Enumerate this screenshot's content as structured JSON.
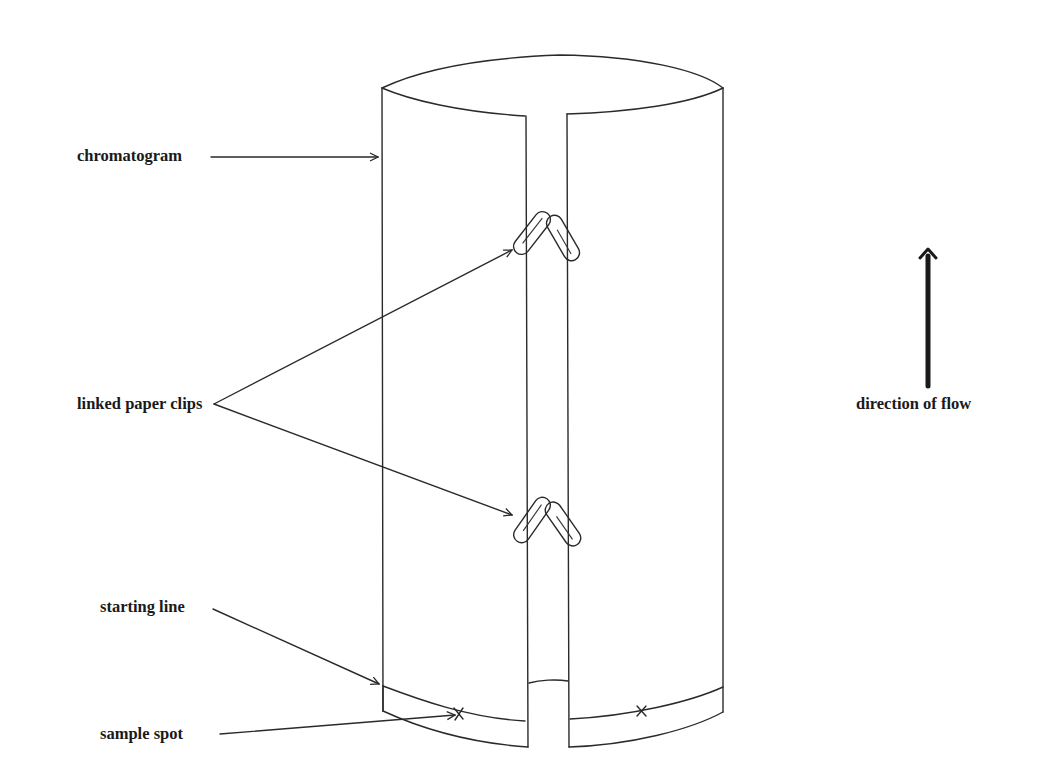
{
  "diagram": {
    "labels": {
      "chromatogram": "chromatogram",
      "paper_clips": "linked paper clips",
      "starting_line": "starting line",
      "sample_spot": "sample spot",
      "flow": "direction of flow"
    },
    "components": [
      {
        "id": "chromatogram",
        "label": "chromatogram",
        "shape": "paper rolled into open cylinder"
      },
      {
        "id": "clip-upper",
        "label": "linked paper clips",
        "position": "upper"
      },
      {
        "id": "clip-lower",
        "label": "linked paper clips",
        "position": "lower"
      },
      {
        "id": "starting-line",
        "label": "starting line"
      },
      {
        "id": "sample-spot-left",
        "label": "sample spot",
        "marker": "x"
      },
      {
        "id": "sample-spot-right",
        "marker": "x"
      },
      {
        "id": "flow-arrow",
        "label": "direction of flow",
        "direction": "up"
      }
    ],
    "colors": {
      "ink": "#1a1a1a",
      "background": "#ffffff"
    }
  }
}
